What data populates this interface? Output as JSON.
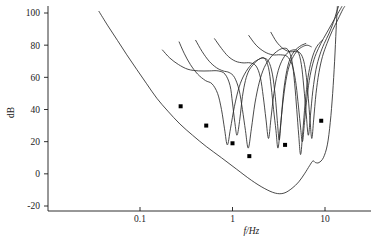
{
  "chart_data": {
    "type": "line",
    "title": "",
    "subtitle": "",
    "xlabel": "f/Hz",
    "ylabel": "dB",
    "xscale": "log",
    "yscale": "linear",
    "xlim": [
      0.03,
      20
    ],
    "ylim": [
      -28,
      104
    ],
    "grid": false,
    "legend": "none",
    "x_ticks": [
      {
        "value": 0.1,
        "label": "0.1"
      },
      {
        "value": 1,
        "label": "1"
      },
      {
        "value": 10,
        "label": "10"
      }
    ],
    "y_ticks": [
      {
        "value": 100,
        "label": "100"
      },
      {
        "value": 80,
        "label": "80"
      },
      {
        "value": 60,
        "label": "60"
      },
      {
        "value": 40,
        "label": "40"
      },
      {
        "value": 20,
        "label": "20"
      },
      {
        "value": 0,
        "label": "0"
      },
      {
        "value": -20,
        "label": "-20"
      }
    ],
    "series": [
      {
        "name": "lower-envelope-curve",
        "type": "line",
        "points": [
          [
            0.036,
            101
          ],
          [
            0.045,
            92
          ],
          [
            0.057,
            83
          ],
          [
            0.072,
            74
          ],
          [
            0.092,
            65
          ],
          [
            0.118,
            56
          ],
          [
            0.152,
            47
          ],
          [
            0.2,
            39
          ],
          [
            0.27,
            31
          ],
          [
            0.37,
            24
          ],
          [
            0.52,
            17
          ],
          [
            0.76,
            10
          ],
          [
            1.1,
            3
          ],
          [
            1.6,
            -4
          ],
          [
            2.2,
            -9
          ],
          [
            2.9,
            -12
          ],
          [
            3.6,
            -12
          ],
          [
            4.4,
            -9
          ],
          [
            5.2,
            -5
          ],
          [
            6.0,
            0
          ],
          [
            6.8,
            5
          ],
          [
            7.4,
            8
          ],
          [
            7.9,
            7
          ],
          [
            8.6,
            7
          ],
          [
            9.6,
            10
          ],
          [
            10.6,
            18
          ],
          [
            11.4,
            32
          ],
          [
            12.1,
            50
          ],
          [
            12.7,
            70
          ],
          [
            13.2,
            90
          ],
          [
            13.6,
            104
          ]
        ]
      },
      {
        "name": "threshold-curve-1",
        "type": "line",
        "points": [
          [
            0.175,
            77
          ],
          [
            0.21,
            72
          ],
          [
            0.26,
            68
          ],
          [
            0.33,
            65
          ],
          [
            0.43,
            64
          ],
          [
            0.56,
            64
          ],
          [
            0.7,
            64
          ],
          [
            0.83,
            62
          ],
          [
            0.94,
            55
          ],
          [
            1.0,
            44
          ],
          [
            1.06,
            32
          ],
          [
            1.12,
            24
          ],
          [
            1.2,
            34
          ],
          [
            1.28,
            48
          ],
          [
            1.38,
            58
          ],
          [
            1.5,
            64
          ],
          [
            1.68,
            68
          ],
          [
            1.9,
            71
          ],
          [
            2.15,
            72
          ],
          [
            2.45,
            70
          ],
          [
            2.7,
            62
          ],
          [
            2.9,
            48
          ],
          [
            3.05,
            33
          ],
          [
            3.2,
            21
          ],
          [
            3.35,
            33
          ],
          [
            3.55,
            50
          ],
          [
            3.8,
            62
          ],
          [
            4.1,
            70
          ],
          [
            4.5,
            75
          ],
          [
            5.0,
            78
          ],
          [
            5.6,
            80
          ],
          [
            6.2,
            81
          ]
        ]
      },
      {
        "name": "threshold-curve-2",
        "type": "line",
        "points": [
          [
            0.265,
            82
          ],
          [
            0.3,
            75
          ],
          [
            0.35,
            68
          ],
          [
            0.42,
            62
          ],
          [
            0.51,
            58
          ],
          [
            0.6,
            56
          ],
          [
            0.69,
            50
          ],
          [
            0.76,
            40
          ],
          [
            0.82,
            28
          ],
          [
            0.88,
            18
          ],
          [
            0.95,
            28
          ],
          [
            1.05,
            42
          ],
          [
            1.18,
            54
          ],
          [
            1.35,
            62
          ],
          [
            1.6,
            68
          ],
          [
            1.9,
            71
          ],
          [
            2.2,
            72
          ],
          [
            2.45,
            66
          ],
          [
            2.62,
            54
          ],
          [
            2.78,
            40
          ],
          [
            2.95,
            27
          ],
          [
            3.1,
            16
          ],
          [
            3.28,
            28
          ],
          [
            3.5,
            44
          ],
          [
            3.78,
            58
          ],
          [
            4.1,
            67
          ],
          [
            4.55,
            73
          ],
          [
            5.1,
            77
          ],
          [
            5.7,
            79
          ],
          [
            6.4,
            80
          ],
          [
            7.1,
            79
          ]
        ]
      },
      {
        "name": "threshold-curve-3",
        "type": "line",
        "points": [
          [
            0.4,
            83
          ],
          [
            0.47,
            76
          ],
          [
            0.56,
            70
          ],
          [
            0.67,
            66
          ],
          [
            0.79,
            64
          ],
          [
            0.92,
            63
          ],
          [
            1.05,
            60
          ],
          [
            1.18,
            52
          ],
          [
            1.28,
            40
          ],
          [
            1.38,
            27
          ],
          [
            1.48,
            16
          ],
          [
            1.6,
            28
          ],
          [
            1.75,
            44
          ],
          [
            1.95,
            57
          ],
          [
            2.2,
            66
          ],
          [
            2.55,
            72
          ],
          [
            3.0,
            76
          ],
          [
            3.5,
            78
          ],
          [
            4.0,
            77
          ],
          [
            4.4,
            70
          ],
          [
            4.7,
            56
          ],
          [
            4.95,
            40
          ],
          [
            5.2,
            24
          ],
          [
            5.45,
            12
          ],
          [
            5.75,
            26
          ],
          [
            6.1,
            44
          ],
          [
            6.55,
            60
          ],
          [
            7.1,
            70
          ],
          [
            7.8,
            77
          ],
          [
            8.6,
            81
          ],
          [
            9.4,
            83
          ]
        ]
      },
      {
        "name": "threshold-curve-4",
        "type": "line",
        "points": [
          [
            0.64,
            84
          ],
          [
            0.76,
            78
          ],
          [
            0.9,
            73
          ],
          [
            1.08,
            70
          ],
          [
            1.3,
            69
          ],
          [
            1.55,
            69
          ],
          [
            1.8,
            67
          ],
          [
            2.0,
            60
          ],
          [
            2.15,
            48
          ],
          [
            2.3,
            34
          ],
          [
            2.45,
            22
          ],
          [
            2.6,
            34
          ],
          [
            2.8,
            50
          ],
          [
            3.05,
            62
          ],
          [
            3.4,
            70
          ],
          [
            3.9,
            75
          ],
          [
            4.5,
            77
          ],
          [
            5.1,
            76
          ],
          [
            5.55,
            68
          ],
          [
            5.9,
            54
          ],
          [
            6.25,
            38
          ],
          [
            6.6,
            24
          ],
          [
            6.95,
            36
          ],
          [
            7.4,
            52
          ],
          [
            8.0,
            65
          ],
          [
            8.8,
            74
          ],
          [
            9.8,
            81
          ],
          [
            11.0,
            87
          ],
          [
            12.3,
            94
          ],
          [
            13.4,
            101
          ],
          [
            14.0,
            104
          ]
        ]
      },
      {
        "name": "threshold-curve-5",
        "type": "line",
        "points": [
          [
            1.5,
            86
          ],
          [
            1.8,
            80
          ],
          [
            2.2,
            76
          ],
          [
            2.7,
            74
          ],
          [
            3.3,
            74
          ],
          [
            3.9,
            73
          ],
          [
            4.4,
            68
          ],
          [
            4.8,
            58
          ],
          [
            5.1,
            45
          ],
          [
            5.4,
            31
          ],
          [
            5.7,
            20
          ],
          [
            6.0,
            32
          ],
          [
            6.4,
            48
          ],
          [
            6.9,
            61
          ],
          [
            7.6,
            71
          ],
          [
            8.5,
            78
          ],
          [
            9.6,
            84
          ],
          [
            11.0,
            90
          ],
          [
            12.6,
            96
          ],
          [
            14.2,
            101
          ],
          [
            15.2,
            104
          ]
        ]
      },
      {
        "name": "threshold-curve-6",
        "type": "line",
        "points": [
          [
            2.6,
            88
          ],
          [
            3.0,
            82
          ],
          [
            3.5,
            78
          ],
          [
            4.1,
            76
          ],
          [
            4.8,
            76
          ],
          [
            5.4,
            75
          ],
          [
            5.9,
            70
          ],
          [
            6.3,
            60
          ],
          [
            6.6,
            47
          ],
          [
            6.9,
            33
          ],
          [
            7.2,
            22
          ],
          [
            7.55,
            34
          ],
          [
            8.0,
            50
          ],
          [
            8.6,
            63
          ],
          [
            9.4,
            73
          ],
          [
            10.5,
            81
          ],
          [
            12.0,
            89
          ],
          [
            13.8,
            96
          ],
          [
            15.5,
            102
          ],
          [
            16.3,
            104
          ]
        ]
      },
      {
        "name": "measured-points",
        "type": "scatter",
        "marker": "square",
        "points": [
          [
            0.275,
            42
          ],
          [
            0.52,
            30
          ],
          [
            1.0,
            19
          ],
          [
            1.52,
            11
          ],
          [
            3.7,
            18
          ],
          [
            9.1,
            33
          ]
        ]
      }
    ]
  },
  "axis": {
    "y_label": "dB",
    "x_label": "f/Hz"
  },
  "colors": {
    "curve": "#2b2b2b",
    "marker": "#000000",
    "axis": "#1a1a1a",
    "background": "#ffffff"
  }
}
